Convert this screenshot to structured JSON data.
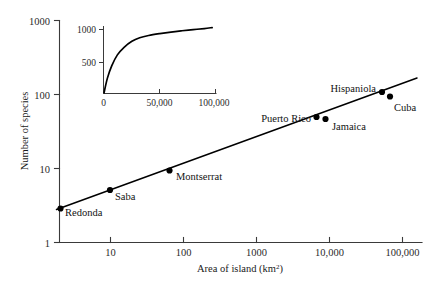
{
  "chart_data": {
    "type": "scatter",
    "title": "",
    "xlabel": "Area of island (km2)",
    "ylabel": "Number of species",
    "xscale": "log",
    "yscale": "log",
    "xlim": [
      2,
      200000
    ],
    "ylim": [
      1,
      1000
    ],
    "xticks": [
      "10",
      "100",
      "1000",
      "10,000",
      "100,000"
    ],
    "xtick_values": [
      10,
      100,
      1000,
      10000,
      100000
    ],
    "yticks": [
      "1",
      "10",
      "100",
      "1000"
    ],
    "ytick_values": [
      1,
      10,
      100,
      1000
    ],
    "grid": false,
    "legend": "none",
    "points": [
      {
        "label": "Redonda",
        "area_km2": 2.6,
        "species": 3,
        "label_pos": "right-below"
      },
      {
        "label": "Saba",
        "area_km2": 10,
        "species": 5,
        "label_pos": "right-below"
      },
      {
        "label": "Montserrat",
        "area_km2": 85,
        "species": 10,
        "label_pos": "right"
      },
      {
        "label": "Puerto Rico",
        "area_km2": 8700,
        "species": 40,
        "label_pos": "left"
      },
      {
        "label": "Jamaica",
        "area_km2": 11400,
        "species": 39,
        "label_pos": "right-below"
      },
      {
        "label": "Hispaniola",
        "area_km2": 76000,
        "species": 84,
        "label_pos": "left-above"
      },
      {
        "label": "Cuba",
        "area_km2": 110000,
        "species": 74,
        "label_pos": "right-below"
      }
    ],
    "fit_line": {
      "description": "straight line on log-log axes (power law species-area relationship)",
      "x_start": 2.3,
      "y_start": 2.85,
      "x_end": 190000,
      "y_end": 108
    },
    "inset": {
      "type": "line",
      "xlabel": "",
      "ylabel": "",
      "xscale": "linear",
      "yscale": "linear",
      "xlim": [
        0,
        100000
      ],
      "ylim": [
        0,
        1100
      ],
      "xticks": [
        "0",
        "50,000",
        "100,000"
      ],
      "xtick_values": [
        0,
        50000,
        100000
      ],
      "yticks": [
        "500",
        "1000"
      ],
      "ytick_values": [
        500,
        1000
      ],
      "grid": false,
      "description": "saturating species-area curve on linear axes",
      "x": [
        0,
        3000,
        7000,
        12000,
        18000,
        25000,
        32000,
        40000,
        50000,
        60000,
        70000,
        80000,
        90000,
        97000
      ],
      "y": [
        0,
        230,
        430,
        600,
        720,
        815,
        870,
        905,
        935,
        960,
        980,
        998,
        1015,
        1030
      ]
    }
  }
}
